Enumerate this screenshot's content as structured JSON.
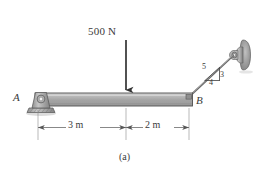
{
  "figure": {
    "caption": "(a)",
    "load_label": "500 N",
    "point_a": "A",
    "point_b": "B",
    "dimension_left": "3 m",
    "dimension_right": "2 m",
    "slope_hyp": "5",
    "slope_vert": "3",
    "slope_horz": "4"
  },
  "colors": {
    "beam_fill": "#a9a9a9",
    "beam_top": "#c9c9c9",
    "outline": "#4a4a4a",
    "text": "#3a3a3a",
    "support": "#9a9a9a",
    "background": "#ffffff"
  }
}
